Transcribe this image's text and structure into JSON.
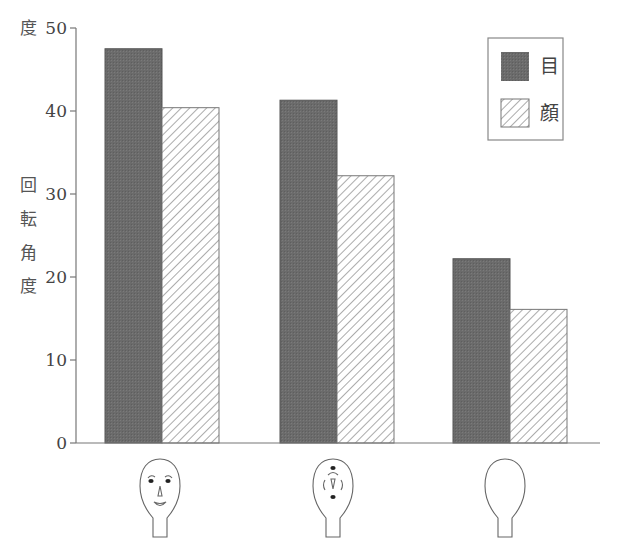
{
  "chart_data": {
    "type": "bar",
    "title": "",
    "xlabel": "",
    "ylabel": "回転角度",
    "ylabel_chars": [
      "回",
      "転",
      "角",
      "度"
    ],
    "ylabel_top_unit": "度",
    "ylim": [
      0,
      50
    ],
    "yticks": [
      0,
      10,
      20,
      30,
      40,
      50
    ],
    "grid": false,
    "legend_position": "top-right",
    "categories": [
      "normal-face",
      "scrambled-face",
      "blank-face"
    ],
    "category_icons": [
      {
        "name": "normal-face-icon",
        "description": "Face with eyes, nose and smiling mouth"
      },
      {
        "name": "scrambled-face-icon",
        "description": "Face with scrambled features (eye top, inverted mouth, bracket brows, inverted nose, eye bottom)"
      },
      {
        "name": "blank-face-icon",
        "description": "Face outline with no features"
      }
    ],
    "series": [
      {
        "name": "目",
        "pattern": "solid-dark",
        "color": "#6b6b6b",
        "values": [
          47.5,
          41.3,
          22.2
        ]
      },
      {
        "name": "顔",
        "pattern": "diagonal-hatch",
        "color": "#ffffff",
        "values": [
          40.4,
          32.2,
          16.1
        ]
      }
    ]
  },
  "axis": {
    "top_unit_label": "度",
    "ylabel_chars": [
      "回",
      "転",
      "角",
      "度"
    ],
    "ticks": [
      "0",
      "10",
      "20",
      "30",
      "40",
      "50"
    ]
  },
  "legend": {
    "items": [
      {
        "label": "目",
        "pattern": "solid-dark"
      },
      {
        "label": "顔",
        "pattern": "diagonal-hatch"
      }
    ]
  }
}
